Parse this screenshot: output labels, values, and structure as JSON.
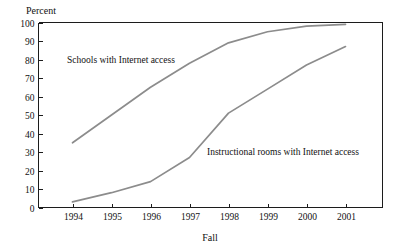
{
  "chart_data": {
    "type": "line",
    "title": "",
    "xlabel": "Fall",
    "ylabel": "Percent",
    "categories": [
      "1994",
      "1995",
      "1996",
      "1997",
      "1998",
      "1999",
      "2000",
      "2001"
    ],
    "ylim": [
      0,
      100
    ],
    "yticks": [
      "0",
      "10",
      "20",
      "30",
      "40",
      "50",
      "60",
      "70",
      "80",
      "90",
      "100"
    ],
    "grid": false,
    "legend_position": "inline-annotations",
    "series": [
      {
        "name": "Schools with Internet access",
        "color": "#8c8c8c",
        "values": [
          35,
          50,
          65,
          78,
          89,
          95,
          98,
          99
        ]
      },
      {
        "name": "Instructional rooms with Internet access",
        "color": "#8c8c8c",
        "values": [
          3,
          8,
          14,
          27,
          51,
          64,
          77,
          87
        ]
      }
    ],
    "annotations": [
      {
        "text": "Schools with Internet access",
        "x": 67,
        "y": 63
      },
      {
        "text": "Instructional rooms with Internet access",
        "x": 207,
        "y": 155
      }
    ]
  },
  "axis": {
    "y_title": "Percent",
    "x_title": "Fall"
  }
}
